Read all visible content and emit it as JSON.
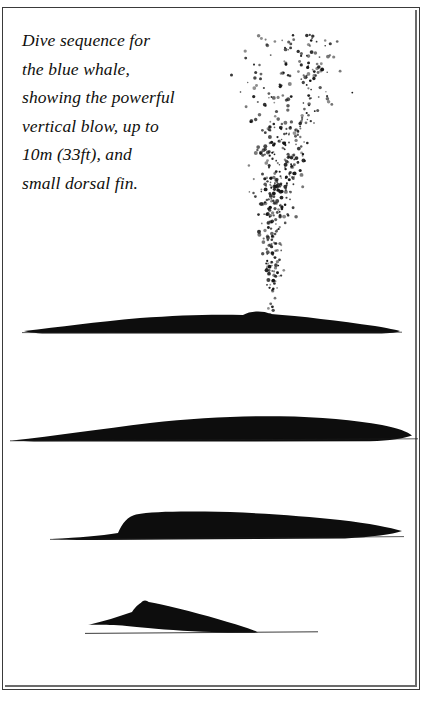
{
  "plate": {
    "background_color": "#ffffff",
    "ink_color": "#100f0d",
    "frame_color": "#3a3a3a"
  },
  "caption": {
    "lines": [
      "Dive sequence for",
      "the blue whale,",
      "showing the powerful",
      "vertical blow, up to",
      "10m (33ft), and",
      "small dorsal fin."
    ],
    "full_text": "Dive sequence for the blue whale, showing the powerful vertical blow, up to 10m (33ft), and small dorsal fin.",
    "style": "italic-serif"
  },
  "illustration": {
    "subject": "blue whale",
    "title": "blue-whale-dive-sequence",
    "blow_height_metric": "10m",
    "blow_height_imperial": "33ft",
    "blow": {
      "name": "vertical-blow-spray",
      "render": "stipple-dots",
      "base_x": 270,
      "base_y": 320,
      "top_y": 34,
      "left_x": 222,
      "right_x": 356,
      "dot_count": 620
    },
    "stages": [
      {
        "name": "stage-1-surfacing-blow",
        "label": "Surfacing with vertical blow",
        "baseline_y": 330,
        "left_x": 24,
        "right_x": 400,
        "peak_y": 314,
        "blowhole_bump_x": 258
      },
      {
        "name": "stage-2-back-arch",
        "label": "Rolling forward, back exposed",
        "baseline_y": 440,
        "left_x": 12,
        "right_x": 412,
        "peak_y": 416,
        "blowhole_bump_x": 0
      },
      {
        "name": "stage-3-arch-rising",
        "label": "Back arching higher",
        "baseline_y": 540,
        "left_x": 52,
        "right_x": 402,
        "peak_y": 512,
        "blowhole_bump_x": 0
      },
      {
        "name": "stage-4-dorsal-fin",
        "label": "Small dorsal fin showing before dive",
        "baseline_y": 633,
        "left_x": 85,
        "right_x": 318,
        "peak_y": 602,
        "blowhole_bump_x": 0
      }
    ]
  }
}
